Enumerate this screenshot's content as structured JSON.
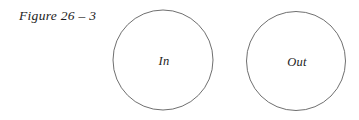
{
  "figure": {
    "caption": "Figure 26 – 3",
    "background_color": "#ffffff",
    "stroke_color": "#5f5f5f",
    "text_color": "#1c1c1c",
    "width": 359,
    "height": 120
  },
  "diagram": {
    "type": "two-disjoint-circles",
    "shapes": [
      {
        "name": "in-circle",
        "label": "In",
        "cx": 163,
        "cy": 60,
        "r": 50
      },
      {
        "name": "out-circle",
        "label": "Out",
        "cx": 296,
        "cy": 61,
        "r": 49.5
      }
    ]
  }
}
